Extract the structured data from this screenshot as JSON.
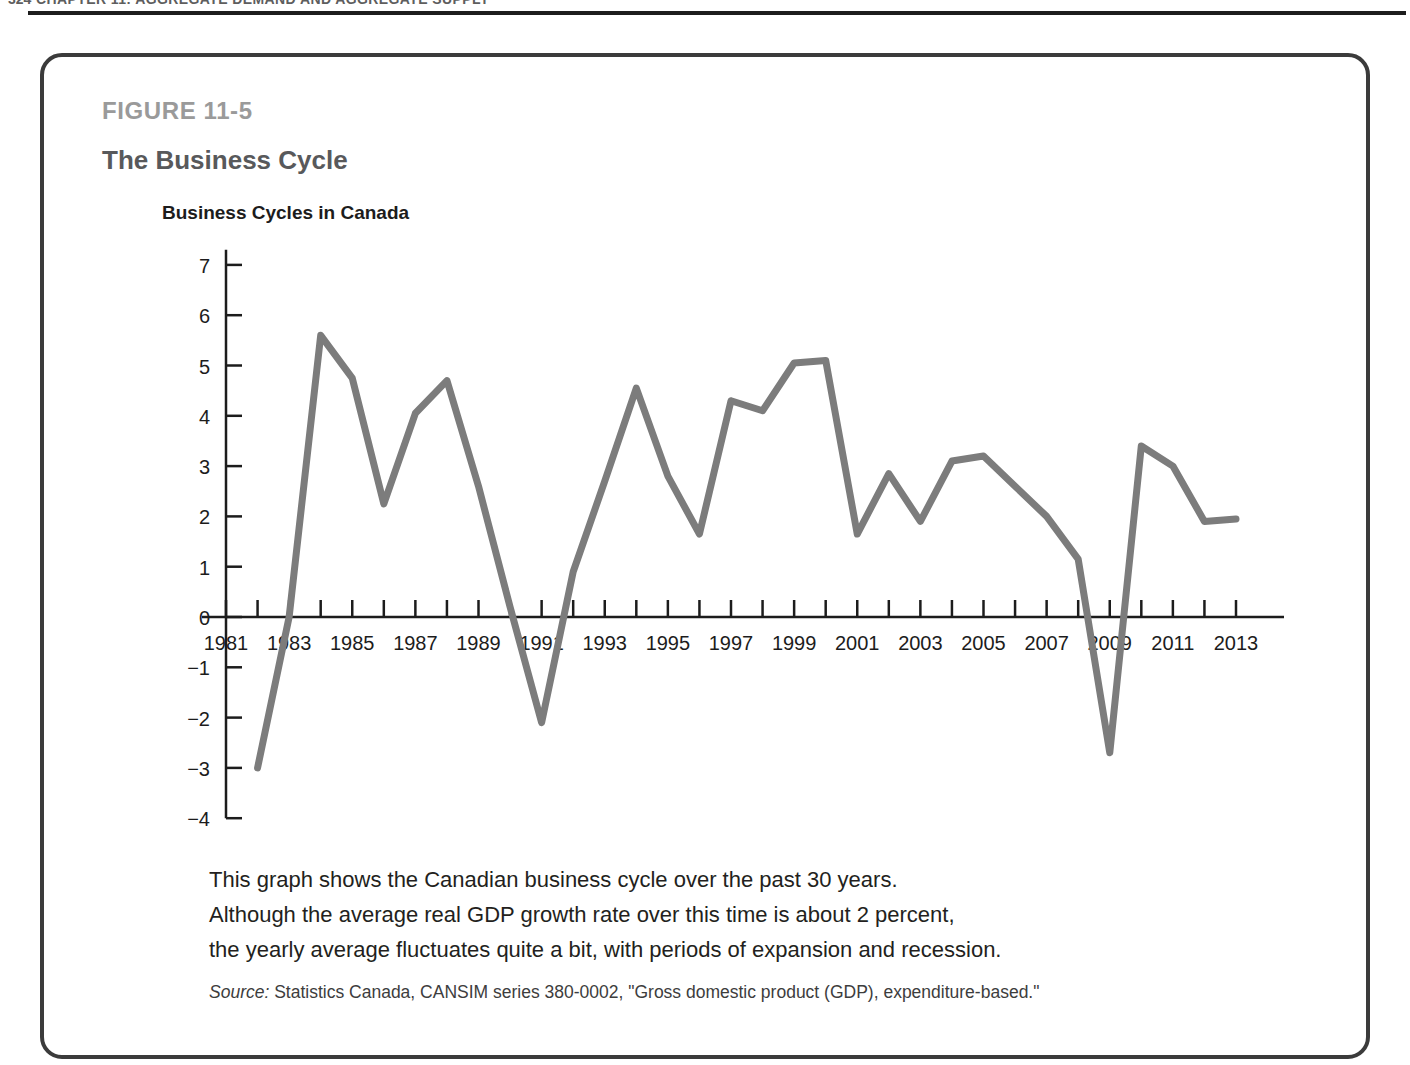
{
  "page_header": {
    "folio": "324",
    "running_head": "CHAPTER 11: AGGREGATE DEMAND AND AGGREGATE SUPPLY"
  },
  "figure": {
    "number_label": "FIGURE 11-5",
    "title": "The Business Cycle",
    "caption_lines": [
      "This graph shows the Canadian business cycle over the past 30 years.",
      "Although the average real GDP growth rate over this time is about 2 percent,",
      "the yearly average fluctuates quite a bit, with periods of expansion and recession."
    ],
    "source_label": "Source:",
    "source_text": " Statistics Canada, CANSIM series 380-0002, \"Gross domestic product (GDP), expenditure-based.\""
  },
  "colors": {
    "line": "#7c7c7c",
    "axis": "#1c1c1c",
    "figure_border": "#3b3b3b",
    "figure_number": "#9a9a9a",
    "figure_title": "#58595b"
  },
  "chart_data": {
    "type": "line",
    "title": "Business Cycles in Canada",
    "xlabel": "",
    "ylabel": "",
    "xlim": [
      1981,
      2013.6
    ],
    "ylim": [
      -4,
      7.3
    ],
    "grid": false,
    "legend": null,
    "y_ticks": [
      7,
      6,
      5,
      4,
      3,
      2,
      1,
      0,
      -1,
      -2,
      -3,
      -4
    ],
    "y_tick_labels": [
      "7",
      "6",
      "5",
      "4",
      "3",
      "2",
      "1",
      "0",
      "−1",
      "−2",
      "−3",
      "−4"
    ],
    "x_ticks": [
      1981,
      1982,
      1983,
      1984,
      1985,
      1986,
      1987,
      1988,
      1989,
      1990,
      1991,
      1992,
      1993,
      1994,
      1995,
      1996,
      1997,
      1998,
      1999,
      2000,
      2001,
      2002,
      2003,
      2004,
      2005,
      2006,
      2007,
      2008,
      2009,
      2010,
      2011,
      2012,
      2013
    ],
    "x_tick_labels_shown": [
      "1981",
      "1983",
      "1985",
      "1987",
      "1989",
      "1991",
      "1993",
      "1995",
      "1997",
      "1999",
      "2001",
      "2003",
      "2005",
      "2007",
      "2009",
      "2011",
      "2013"
    ],
    "series": [
      {
        "name": "Real GDP growth rate (percent)",
        "x": [
          1982,
          1983,
          1984,
          1985,
          1986,
          1987,
          1988,
          1989,
          1990,
          1991,
          1992,
          1993,
          1994,
          1995,
          1996,
          1997,
          1998,
          1999,
          2000,
          2001,
          2002,
          2003,
          2004,
          2005,
          2006,
          2007,
          2008,
          2009,
          2010,
          2011,
          2012,
          2013
        ],
        "values": [
          -3.0,
          0.0,
          5.6,
          4.75,
          2.25,
          4.05,
          4.7,
          2.6,
          0.2,
          -2.1,
          0.9,
          2.7,
          4.55,
          2.8,
          1.65,
          4.3,
          4.1,
          5.05,
          5.1,
          1.65,
          2.85,
          1.9,
          3.1,
          3.2,
          2.6,
          2.0,
          1.15,
          -2.7,
          3.4,
          3.0,
          1.9,
          1.95
        ]
      }
    ]
  }
}
